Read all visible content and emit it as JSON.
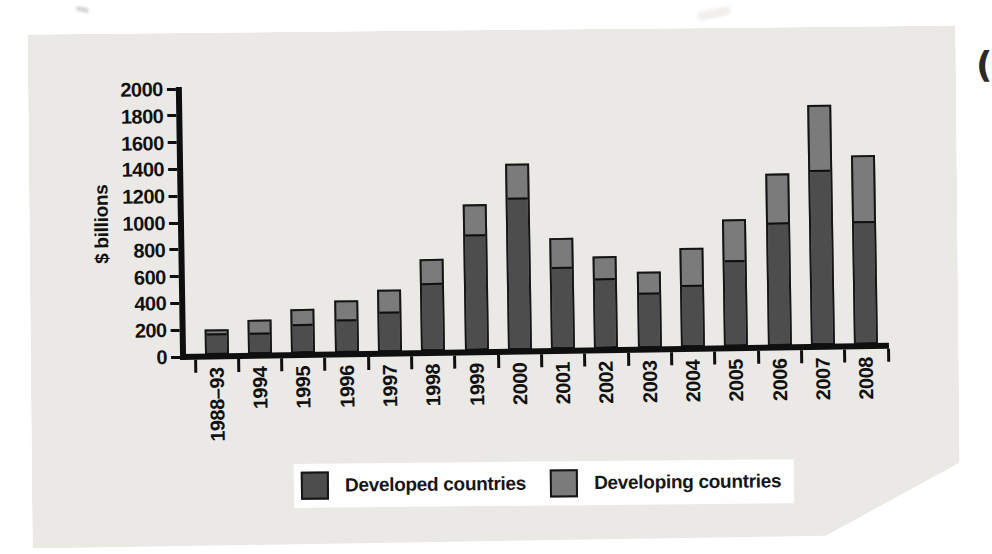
{
  "chart_data": {
    "type": "bar",
    "stacked": true,
    "title": "",
    "ylabel": "$ billions",
    "xlabel": "",
    "ylim": [
      0,
      2000
    ],
    "ytick_step": 200,
    "yticks": [
      2000,
      1800,
      1600,
      1400,
      1200,
      1000,
      800,
      600,
      400,
      200,
      0
    ],
    "grid": false,
    "legend_position": "bottom",
    "categories": [
      "1988–93",
      "1994",
      "1995",
      "1996",
      "1997",
      "1998",
      "1999",
      "2000",
      "2001",
      "2002",
      "2003",
      "2004",
      "2005",
      "2006",
      "2007",
      "2008"
    ],
    "series": [
      {
        "name": "Developed countries",
        "color": "#4d4d4d",
        "values": [
          140,
          145,
          205,
          230,
          285,
          490,
          850,
          1120,
          600,
          510,
          395,
          450,
          630,
          900,
          1290,
          900
        ]
      },
      {
        "name": "Developing countries",
        "color": "#7b7b7b",
        "values": [
          50,
          110,
          125,
          155,
          175,
          200,
          240,
          270,
          225,
          175,
          175,
          290,
          315,
          380,
          500,
          510
        ]
      }
    ]
  },
  "colors": {
    "panel_background": "#eae9e5",
    "page_background": "#ffffff",
    "axis": "#0f0f0f",
    "legend_background": "#fefefe"
  },
  "artifacts": {
    "corner_glyph": "("
  }
}
